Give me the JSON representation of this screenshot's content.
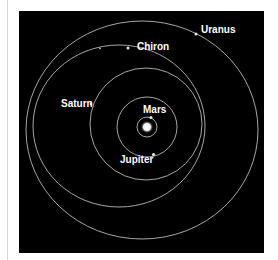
{
  "diagram": {
    "type": "orbital-diagram",
    "background_color": "#000000",
    "orbit_color": "#cfcfcf",
    "label_color": "#ffffff",
    "center": {
      "name": "Sun",
      "icon": "sun-glow"
    },
    "bodies": [
      {
        "name": "Mars",
        "label": "Mars"
      },
      {
        "name": "Jupiter",
        "label": "Jupiter"
      },
      {
        "name": "Saturn",
        "label": "Saturn"
      },
      {
        "name": "Chiron",
        "label": "Chiron"
      },
      {
        "name": "Uranus",
        "label": "Uranus"
      }
    ]
  }
}
